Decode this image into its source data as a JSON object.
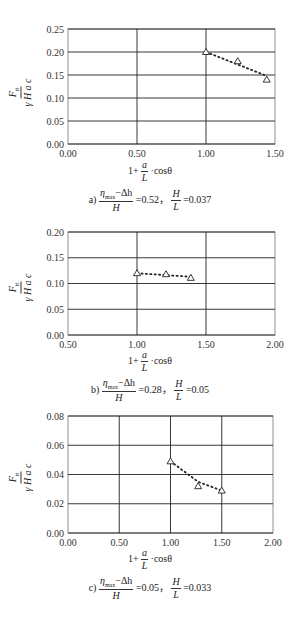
{
  "figure": {
    "y_label_num": "F",
    "y_label_num_sub": "tt",
    "y_label_den": "γ H a c",
    "x_label_prefix": "1+",
    "x_label_frac_num": "a",
    "x_label_frac_den": "L",
    "x_label_suffix": "·cosθ"
  },
  "captions": [
    {
      "letter": "a)",
      "frac1_num": "η",
      "frac1_num_sub": "max",
      "frac1_num_rest": "−Δh",
      "frac1_den": "H",
      "val1": "=0.52，",
      "frac2_num": "H",
      "frac2_den": "L",
      "val2": "=0.037"
    },
    {
      "letter": "b)",
      "frac1_num": "η",
      "frac1_num_sub": "max",
      "frac1_num_rest": "−Δh",
      "frac1_den": "H",
      "val1": "=0.28，",
      "frac2_num": "H",
      "frac2_den": "L",
      "val2": "=0.05"
    },
    {
      "letter": "c)",
      "frac1_num": "η",
      "frac1_num_sub": "max",
      "frac1_num_rest": "−Δh",
      "frac1_den": "H",
      "val1": "=0.05，",
      "frac2_num": "H",
      "frac2_den": "L",
      "val2": "=0.033"
    }
  ],
  "chart_data": [
    {
      "type": "scatter",
      "title": "a) (η_max−Δh)/H = 0.52, H/L = 0.037",
      "xlabel": "1 + (a/L)·cosθ",
      "ylabel": "F_tt / (γ H a c)",
      "xlim": [
        0.0,
        1.5
      ],
      "ylim": [
        0.0,
        0.25
      ],
      "xticks": [
        "0.00",
        "0.50",
        "1.00",
        "1.50"
      ],
      "yticks": [
        "0.00",
        "0.05",
        "0.10",
        "0.15",
        "0.20",
        "0.25"
      ],
      "grid": true,
      "marker": "triangle-open",
      "trendline": "dotted",
      "x": [
        1.0,
        1.23,
        1.44
      ],
      "y": [
        0.2,
        0.18,
        0.14
      ],
      "trend": [
        [
          1.0,
          0.2
        ],
        [
          1.44,
          0.148
        ]
      ]
    },
    {
      "type": "scatter",
      "title": "b) (η_max−Δh)/H = 0.28, H/L = 0.05",
      "xlabel": "1 + (a/L)·cosθ",
      "ylabel": "F_tt / (γ H a c)",
      "xlim": [
        0.5,
        2.0
      ],
      "ylim": [
        0.0,
        0.2
      ],
      "xticks": [
        "0.50",
        "1.00",
        "1.50",
        "2.00"
      ],
      "yticks": [
        "0.00",
        "0.05",
        "0.10",
        "0.15",
        "0.20"
      ],
      "grid": true,
      "marker": "triangle-open",
      "trendline": "dotted",
      "x": [
        1.0,
        1.21,
        1.39
      ],
      "y": [
        0.12,
        0.118,
        0.111
      ],
      "trend": [
        [
          1.0,
          0.12
        ],
        [
          1.39,
          0.113
        ]
      ]
    },
    {
      "type": "scatter",
      "title": "c) (η_max−Δh)/H = 0.05, H/L = 0.033",
      "xlabel": "1 + (a/L)·cosθ",
      "ylabel": "F_tt / (γ H a c)",
      "xlim": [
        0.0,
        2.0
      ],
      "ylim": [
        0.0,
        0.08
      ],
      "xticks": [
        "0.00",
        "0.50",
        "1.00",
        "1.50",
        "2.00"
      ],
      "yticks": [
        "0.00",
        "0.02",
        "0.04",
        "0.06",
        "0.08"
      ],
      "grid": true,
      "marker": "triangle-open",
      "trendline": "dotted",
      "x": [
        1.0,
        1.27,
        1.5
      ],
      "y": [
        0.049,
        0.032,
        0.029
      ],
      "trend": [
        [
          1.0,
          0.049
        ],
        [
          1.27,
          0.035
        ],
        [
          1.5,
          0.029
        ]
      ]
    }
  ]
}
